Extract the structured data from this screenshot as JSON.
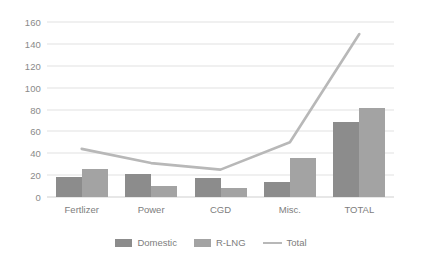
{
  "chart_data": {
    "type": "bar",
    "title": "",
    "subtitle": "",
    "xlabel": "",
    "ylabel": "",
    "categories": [
      "Fertlizer",
      "Power",
      "CGD",
      "Misc.",
      "TOTAL"
    ],
    "series": [
      {
        "name": "Domestic",
        "type": "bar",
        "values": [
          18,
          21,
          17,
          14,
          69
        ]
      },
      {
        "name": "R-LNG",
        "type": "bar",
        "values": [
          26,
          10,
          8,
          36,
          81
        ]
      },
      {
        "name": "Total",
        "type": "line",
        "values": [
          44,
          31,
          25,
          50,
          149
        ]
      }
    ],
    "ylim": [
      0,
      160
    ],
    "ytick_step": 20,
    "yticks": [
      160,
      140,
      120,
      100,
      80,
      60,
      40,
      20,
      0
    ],
    "grid": "horizontal",
    "legend_position": "bottom",
    "colors": {
      "domestic": "#8c8c8c",
      "rlng": "#a3a3a3",
      "total_line": "#b8b8b8",
      "gridline": "#e2e2e2",
      "axis_text": "#8a8a8a",
      "background": "#ffffff"
    }
  },
  "legend": {
    "items": [
      {
        "label": "Domestic",
        "marker": "square-swatch-icon"
      },
      {
        "label": "R-LNG",
        "marker": "square-swatch-icon"
      },
      {
        "label": "Total",
        "marker": "line-swatch-icon"
      }
    ]
  }
}
